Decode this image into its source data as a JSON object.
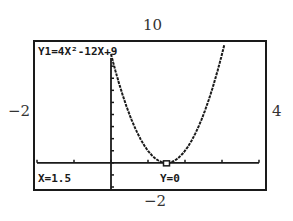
{
  "window_labels": {
    "ymax": "10",
    "ymin": "−2",
    "xmin": "−2",
    "xmax": "4"
  },
  "screen": {
    "equation": "Y1=4X²-12X+9",
    "trace_x": "X=1.5",
    "trace_y": "Y=0"
  },
  "colors": {
    "ink": "#1a1a1a",
    "background": "#ffffff"
  },
  "chart_data": {
    "type": "line",
    "title": "Y1=4X²-12X+9",
    "function": "4x^2 - 12x + 9",
    "xlim": [
      -2,
      4
    ],
    "ylim": [
      -2,
      10
    ],
    "xscl": 1,
    "yscl": 1,
    "grid": false,
    "x": [
      0,
      0.25,
      0.5,
      0.75,
      1,
      1.25,
      1.5,
      1.75,
      2,
      2.25,
      2.5,
      2.75,
      3,
      3.25
    ],
    "y": [
      9,
      6.25,
      4,
      2.25,
      1,
      0.25,
      0,
      0.25,
      1,
      2.25,
      4,
      6.25,
      9,
      12.25
    ],
    "trace_point": {
      "x": 1.5,
      "y": 0
    },
    "annotations": [
      "X=1.5",
      "Y=0"
    ],
    "xlabel": "",
    "ylabel": ""
  }
}
